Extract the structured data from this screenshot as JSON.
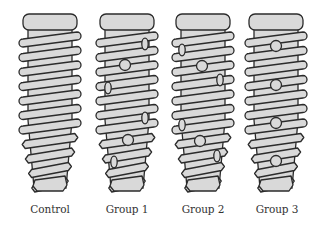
{
  "figure": {
    "type": "diagram",
    "colors": {
      "fill": "#d9d9d9",
      "stroke": "#2b2b2b",
      "background": "#ffffff",
      "label": "#333333"
    },
    "implants": [
      {
        "label": "Control",
        "center_x": 50,
        "holes": []
      },
      {
        "label": "Group 1",
        "center_x": 127,
        "holes": [
          {
            "x": 145,
            "y": 44,
            "shape": "side"
          },
          {
            "x": 125,
            "y": 65,
            "shape": "front"
          },
          {
            "x": 108,
            "y": 88,
            "shape": "side"
          },
          {
            "x": 145,
            "y": 118,
            "shape": "side"
          },
          {
            "x": 128,
            "y": 140,
            "shape": "front"
          },
          {
            "x": 114,
            "y": 162,
            "shape": "side"
          }
        ]
      },
      {
        "label": "Group 2",
        "center_x": 203,
        "holes": [
          {
            "x": 182,
            "y": 50,
            "shape": "side"
          },
          {
            "x": 202,
            "y": 66,
            "shape": "front"
          },
          {
            "x": 220,
            "y": 80,
            "shape": "side"
          },
          {
            "x": 182,
            "y": 125,
            "shape": "side"
          },
          {
            "x": 200,
            "y": 141,
            "shape": "front"
          },
          {
            "x": 217,
            "y": 156,
            "shape": "side"
          }
        ]
      },
      {
        "label": "Group 3",
        "center_x": 276,
        "holes": [
          {
            "x": 276,
            "y": 46,
            "shape": "front"
          },
          {
            "x": 276,
            "y": 85,
            "shape": "front"
          },
          {
            "x": 276,
            "y": 123,
            "shape": "front"
          },
          {
            "x": 276,
            "y": 161,
            "shape": "front"
          }
        ]
      }
    ]
  }
}
